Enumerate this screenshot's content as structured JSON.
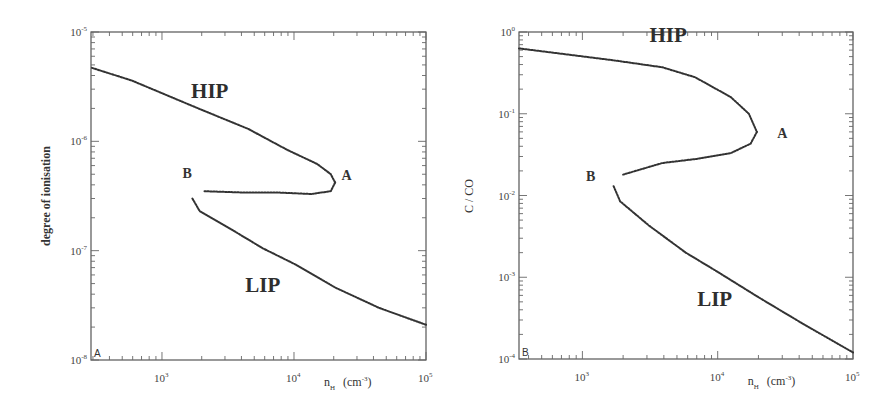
{
  "chart_data": [
    {
      "type": "line",
      "panel_id": "A",
      "title": "",
      "xlabel": "n_H (cm^-3)",
      "xlabel_main": "n",
      "xlabel_sub": "H",
      "xlabel_unit": "(cm",
      "xlabel_unit_sup": "-3",
      "xlabel_unit_close": ")",
      "ylabel": "degree of ionisation",
      "xscale": "log",
      "yscale": "log",
      "xlim": [
        290,
        100000
      ],
      "ylim": [
        1e-08,
        1e-05
      ],
      "x_ticks": [
        {
          "value": 1000,
          "base": "10",
          "exp": "3"
        },
        {
          "value": 10000,
          "base": "10",
          "exp": "4"
        },
        {
          "value": 100000,
          "base": "10",
          "exp": "5"
        }
      ],
      "y_ticks": [
        {
          "value": 1e-05,
          "base": "10",
          "exp": "-5"
        },
        {
          "value": 1e-06,
          "base": "10",
          "exp": "-6"
        },
        {
          "value": 1e-07,
          "base": "10",
          "exp": "-7"
        },
        {
          "value": 1e-08,
          "base": "10",
          "exp": "-8"
        }
      ],
      "annotations": [
        {
          "text": "HIP",
          "x": 2300,
          "y": 2.5e-06,
          "kind": "region"
        },
        {
          "text": "LIP",
          "x": 5800,
          "y": 4.2e-08,
          "kind": "region"
        },
        {
          "text": "A",
          "x": 25000,
          "y": 4.4e-07,
          "kind": "point"
        },
        {
          "text": "B",
          "x": 1550,
          "y": 4.6e-07,
          "kind": "point"
        }
      ],
      "series": [
        {
          "name": "HIP branch",
          "x": [
            295,
            590,
            1880,
            4500,
            9000,
            15000,
            19000,
            20500
          ],
          "y": [
            4.7e-06,
            3.6e-06,
            2e-06,
            1.3e-06,
            8.3e-07,
            6.2e-07,
            5e-07,
            4.2e-07
          ]
        },
        {
          "name": "unstable branch (A to B)",
          "x": [
            20500,
            19000,
            13500,
            7800,
            4300,
            2100
          ],
          "y": [
            4.2e-07,
            3.5e-07,
            3.3e-07,
            3.4e-07,
            3.4e-07,
            3.5e-07
          ]
        },
        {
          "name": "LIP branch",
          "x": [
            1700,
            1930,
            3250,
            5800,
            10200,
            20500,
            44000,
            100000
          ],
          "y": [
            3e-07,
            2.3e-07,
            1.6e-07,
            1.05e-07,
            7.5e-08,
            4.6e-08,
            3e-08,
            2.1e-08
          ]
        }
      ]
    },
    {
      "type": "line",
      "panel_id": "B",
      "title": "",
      "xlabel": "n_H (cm^-3)",
      "xlabel_main": "n",
      "xlabel_sub": "H",
      "xlabel_unit": "(cm",
      "xlabel_unit_sup": "-3",
      "xlabel_unit_close": ")",
      "ylabel": "C / CO",
      "xscale": "log",
      "yscale": "log",
      "xlim": [
        340,
        100000
      ],
      "ylim": [
        0.0001,
        1
      ],
      "x_ticks": [
        {
          "value": 1000,
          "base": "10",
          "exp": "3"
        },
        {
          "value": 10000,
          "base": "10",
          "exp": "4"
        },
        {
          "value": 100000,
          "base": "10",
          "exp": "5"
        }
      ],
      "y_ticks": [
        {
          "value": 1,
          "base": "10",
          "exp": "0"
        },
        {
          "value": 0.1,
          "base": "10",
          "exp": "-1"
        },
        {
          "value": 0.01,
          "base": "10",
          "exp": "-2"
        },
        {
          "value": 0.001,
          "base": "10",
          "exp": "-3"
        },
        {
          "value": 0.0001,
          "base": "10",
          "exp": "-4"
        }
      ],
      "annotations": [
        {
          "text": "HIP",
          "x": 4300,
          "y": 0.75,
          "kind": "region"
        },
        {
          "text": "LIP",
          "x": 9500,
          "y": 0.00044,
          "kind": "region"
        },
        {
          "text": "A",
          "x": 30000,
          "y": 0.05,
          "kind": "point"
        },
        {
          "text": "B",
          "x": 1150,
          "y": 0.015,
          "kind": "point"
        }
      ],
      "series": [
        {
          "name": "HIP branch",
          "x": [
            340,
            1700,
            3900,
            6800,
            12500,
            17000,
            19500
          ],
          "y": [
            0.63,
            0.45,
            0.37,
            0.28,
            0.16,
            0.1,
            0.06
          ]
        },
        {
          "name": "unstable branch (A to B)",
          "x": [
            19500,
            17500,
            12500,
            7000,
            3900,
            2000
          ],
          "y": [
            0.06,
            0.043,
            0.033,
            0.028,
            0.025,
            0.018
          ]
        },
        {
          "name": "LIP branch",
          "x": [
            1700,
            1900,
            3100,
            5800,
            9700,
            20000,
            41000,
            100000
          ],
          "y": [
            0.013,
            0.0085,
            0.0043,
            0.002,
            0.0012,
            0.00057,
            0.00028,
            0.00012
          ]
        }
      ]
    }
  ]
}
